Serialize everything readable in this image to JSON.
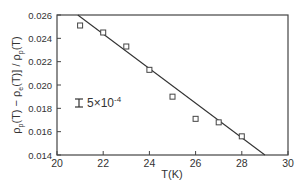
{
  "chart_data": {
    "type": "scatter",
    "title": "",
    "xlabel": "T(K)",
    "ylabel": "[ρ_p(T) − ρ_e(T)] / ρ_p(T)",
    "xlim": [
      20,
      30
    ],
    "ylim": [
      0.014,
      0.026
    ],
    "x_ticks": [
      "20",
      "22",
      "24",
      "26",
      "28",
      "30"
    ],
    "y_ticks": [
      "0.014",
      "0.016",
      "0.018",
      "0.020",
      "0.022",
      "0.024",
      "0.026"
    ],
    "grid": false,
    "legend": null,
    "series": [
      {
        "name": "data",
        "marker": "open-square",
        "x": [
          21,
          22,
          23,
          24,
          25,
          26,
          27,
          28
        ],
        "y": [
          0.0251,
          0.0245,
          0.0233,
          0.0213,
          0.019,
          0.0171,
          0.0168,
          0.0156
        ]
      },
      {
        "name": "linear fit",
        "style": "line",
        "x": [
          20.9,
          29.0
        ],
        "y": [
          0.026,
          0.014
        ]
      }
    ],
    "annotations": [
      {
        "text": "5×10",
        "superscript": "-4",
        "note": "error bar size",
        "x": 21.2,
        "y": 0.0185
      }
    ]
  },
  "labels": {
    "xlabel": "T(K)",
    "ylabel_main": "ρ",
    "annotation_text": "5×10",
    "annotation_exp": "-4"
  }
}
